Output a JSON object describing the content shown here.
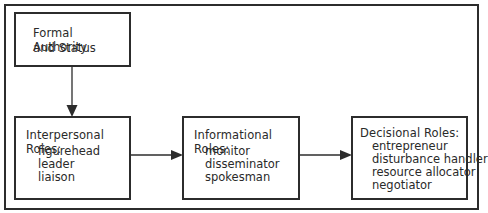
{
  "diagram": {
    "source_box": {
      "lines": [
        "Formal Authority",
        "and Status"
      ]
    },
    "role_boxes": [
      {
        "title": "Interpersonal Roles:",
        "items": [
          "figurehead",
          "leader",
          "liaison"
        ]
      },
      {
        "title": "Informational Roles:",
        "items": [
          "monitor",
          "disseminator",
          "spokesman"
        ]
      },
      {
        "title": "Decisional Roles:",
        "items": [
          "entrepreneur",
          "disturbance handler",
          "resource allocator",
          "negotiator"
        ]
      }
    ],
    "edges": [
      {
        "from": "Formal Authority and Status",
        "to": "Interpersonal Roles"
      },
      {
        "from": "Interpersonal Roles",
        "to": "Informational Roles"
      },
      {
        "from": "Informational Roles",
        "to": "Decisional Roles"
      }
    ],
    "colors": {
      "line": "#2c2c2c",
      "text": "#2a2a2a",
      "background": "#ffffff"
    }
  }
}
